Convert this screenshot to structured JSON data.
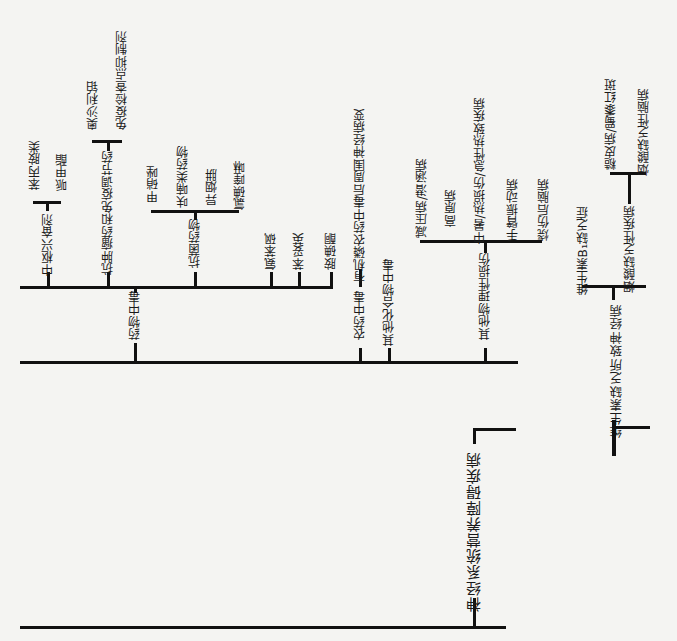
{
  "diagram": {
    "type": "tree",
    "orientation": "rotated-90",
    "root": {
      "label": "神经系统营养障碍疾病",
      "children": [
        {
          "label": "药物中毒",
          "children": [
            {
              "label": "中枢兴奋剂",
              "children": [
                {
                  "label": "苯丙胺类"
                },
                {
                  "label": "哌甲酯"
                }
              ]
            },
            {
              "label": "抗肿瘤药和免疫调节药",
              "children": [
                {
                  "label": "奥沙利铂"
                },
                {
                  "label": "免疫检查点抑制剂"
                }
              ]
            },
            {
              "label": "抗菌药物",
              "children": [
                {
                  "label": "甲硝唑"
                },
                {
                  "label": "呋喃类药物"
                },
                {
                  "label": "异烟肼"
                },
                {
                  "label": "氯碘喹啉"
                }
              ]
            },
            {
              "label": "氨苯砜"
            },
            {
              "label": "苯妥英"
            },
            {
              "label": "胺碘酮"
            }
          ]
        },
        {
          "label": "农药中毒",
          "children": [
            {
              "label": "有机磷农药中毒后周围神经病变"
            }
          ]
        },
        {
          "label": "其他化合物中毒"
        },
        {
          "label": "其他物理性损伤",
          "children": [
            {
              "label": "减压病/潜涵病"
            },
            {
              "label": "高原病"
            },
            {
              "label": "中暑/热损伤/急性热致疾病"
            },
            {
              "label": "手臂振动病"
            },
            {
              "label": "烧伤后脑病"
            }
          ]
        },
        {
          "label": "维生素缺乏所致神经病",
          "children": [
            {
              "label": "维生素B1缺乏症"
            },
            {
              "label": "烟酸缺乏性疾病",
              "children": [
                {
                  "label": "糙皮病/蜀黍红斑"
                },
                {
                  "label": "烟酸缺乏性脑病"
                }
              ]
            }
          ]
        }
      ]
    }
  },
  "labels": {
    "root": "神经系统营养障碍疾病",
    "drug": "药物中毒",
    "cns": "中枢兴奋剂",
    "amph": "苯丙胺类",
    "mph": "哌甲酯",
    "onco": "抗肿瘤药和免疫调节药",
    "oxa": "奥沙利铂",
    "ici": "免疫检查点抑制剂",
    "abx": "抗菌药物",
    "metro": "甲硝唑",
    "furan": "呋喃类药物",
    "inh": "异烟肼",
    "clio": "氯碘喹啉",
    "dapsone": "氨苯砜",
    "phenytoin": "苯妥英",
    "amio": "胺碘酮",
    "pest": "农药中毒",
    "op": "有机磷农药中毒后周围神经病变",
    "other_chem": "其他化合物中毒",
    "phys": "其他物理性损伤",
    "decomp": "减压病/潜涵病",
    "altitude": "高原病",
    "heat": "中暑/热损伤/急性热致疾病",
    "havs": "手臂振动病",
    "burn": "烧伤后脑病",
    "vit": "维生素缺乏所致神经病",
    "b1": "维生素B₁缺乏症",
    "niacin": "烟酸缺乏性疾病",
    "pellagra": "糙皮病/蜀黍红斑",
    "niacin_enc": "烟酸缺乏性脑病"
  }
}
